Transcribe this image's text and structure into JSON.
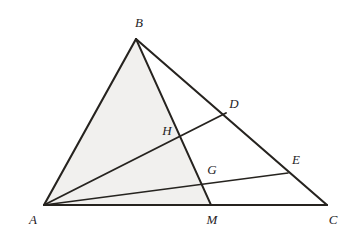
{
  "figure": {
    "canvas": {
      "width": 353,
      "height": 236
    },
    "background_color": "#ffffff",
    "ink_color": "#26231f",
    "shade_color": "#f1f0ee"
  },
  "points": [
    {
      "id": "A",
      "label": "A",
      "x": 44,
      "y": 205,
      "label_x": 33,
      "label_y": 224
    },
    {
      "id": "B",
      "label": "B",
      "x": 136,
      "y": 39,
      "label_x": 139,
      "label_y": 27
    },
    {
      "id": "C",
      "label": "C",
      "x": 327,
      "y": 205,
      "label_x": 333,
      "label_y": 224
    },
    {
      "id": "D",
      "label": "D",
      "x": 226,
      "y": 113,
      "label_x": 234,
      "label_y": 108
    },
    {
      "id": "E",
      "label": "E",
      "x": 288,
      "y": 173,
      "label_x": 296,
      "label_y": 164
    },
    {
      "id": "H",
      "label": "H",
      "x": 178,
      "y": 139,
      "label_x": 167,
      "label_y": 135
    },
    {
      "id": "G",
      "label": "G",
      "x": 203,
      "y": 180,
      "label_x": 212,
      "label_y": 174
    },
    {
      "id": "M",
      "label": "M",
      "x": 211,
      "y": 205,
      "label_x": 212,
      "label_y": 224
    }
  ],
  "shaded_regions": [
    {
      "id": "triangle-ABM",
      "name": "shaded-triangle-abm",
      "vertices": "A,B,M",
      "path": "44,205 136,39 211,205",
      "fill": "#f1f0ee"
    }
  ],
  "segments": [
    {
      "id": "AB",
      "name": "segment-ab",
      "from": "A",
      "to": "B",
      "path": "44,205 136,39",
      "width": 2.1
    },
    {
      "id": "BC",
      "name": "segment-bc",
      "from": "B",
      "to": "C",
      "path": "136,39 327,205",
      "width": 2.1
    },
    {
      "id": "AC",
      "name": "segment-ac",
      "from": "A",
      "to": "C",
      "path": "44,205 327,205",
      "width": 2.1
    },
    {
      "id": "BM",
      "name": "cevian-bm",
      "from": "B",
      "to": "M",
      "path": "136,39 211,205",
      "width": 1.9
    },
    {
      "id": "AD",
      "name": "cevian-ad",
      "from": "A",
      "to": "D",
      "path": "44,205 226,113",
      "width": 1.9
    },
    {
      "id": "AE",
      "name": "cevian-ae",
      "from": "A",
      "to": "E",
      "path": "44,205 288,173",
      "width": 1.6
    }
  ],
  "intersections": [
    {
      "id": "H",
      "name": "intersection-h",
      "of": "AD,BM"
    },
    {
      "id": "G",
      "name": "intersection-g",
      "of": "AE,BM"
    }
  ]
}
